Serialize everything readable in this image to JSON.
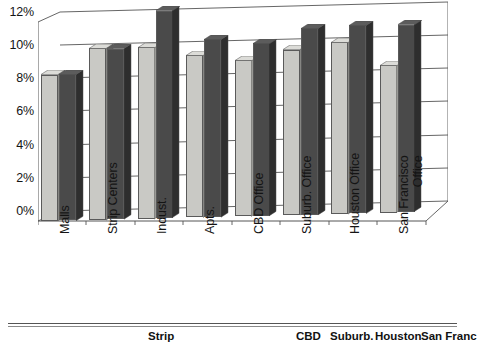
{
  "chart_data": {
    "type": "bar",
    "title": "",
    "xlabel": "",
    "ylabel": "",
    "ylim": [
      0,
      0.12
    ],
    "grid": true,
    "legend_position": "none",
    "y_ticks": [
      "0%",
      "2%",
      "4%",
      "6%",
      "8%",
      "10%",
      "12%"
    ],
    "y_tick_values": [
      0,
      2,
      4,
      6,
      8,
      10,
      12
    ],
    "categories": [
      "Malls",
      "Strip Centers",
      "Indust.",
      "Apts.",
      "CBD Office",
      "Suburb. Office",
      "Houston Office",
      "San Francisco Office"
    ],
    "category_lines": [
      [
        "Malls"
      ],
      [
        "Strip Centers"
      ],
      [
        "Indust."
      ],
      [
        "Apts."
      ],
      [
        "CBD Office"
      ],
      [
        "Suburb. Office"
      ],
      [
        "Houston Office"
      ],
      [
        "San Francisco",
        "Office"
      ]
    ],
    "series": [
      {
        "name": "Series 1",
        "color": "#c9c9c5",
        "values": [
          8.4,
          9.85,
          9.85,
          9.3,
          8.95,
          9.5,
          9.85,
          8.45
        ]
      },
      {
        "name": "Series 2",
        "color": "#4a4a4a",
        "values": [
          8.4,
          9.8,
          11.9,
          10.2,
          9.9,
          10.7,
          10.8,
          10.75
        ]
      }
    ],
    "axis_unit": "percent"
  },
  "footer": {
    "columns": [
      {
        "label": "Strip",
        "x": 148
      },
      {
        "label": "CBD",
        "x": 296
      },
      {
        "label": "Suburb.",
        "x": 330
      },
      {
        "label": "Houston",
        "x": 375
      },
      {
        "label": "San Franc",
        "x": 421
      }
    ]
  }
}
